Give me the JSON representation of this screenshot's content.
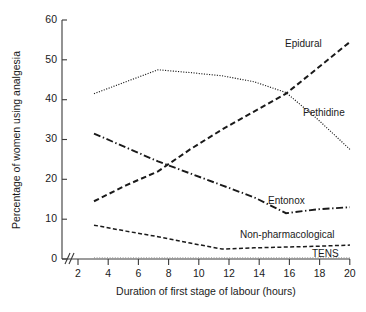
{
  "chart_data": {
    "type": "line",
    "title": "",
    "subtitle": "",
    "xlabel": "Duration of first stage of labour (hours)",
    "ylabel": "Percentage of women using analgesia",
    "xlim": [
      2,
      20
    ],
    "ylim": [
      0,
      60
    ],
    "x_ticks": [
      2,
      4,
      6,
      8,
      10,
      12,
      14,
      16,
      18,
      20
    ],
    "y_ticks": [
      0,
      10,
      20,
      30,
      40,
      50,
      60
    ],
    "grid": false,
    "legend_position": "inline-right",
    "axis_break": "//",
    "axis_break_note": "x-axis broken between origin and first tick",
    "x": [
      4,
      6,
      8,
      10,
      12,
      14,
      16,
      18,
      20
    ],
    "series": [
      {
        "name": "Epidural",
        "style": "dashed",
        "values": [
          14.5,
          18.5,
          22.0,
          27.5,
          32.5,
          37.0,
          41.5,
          48.0,
          54.5
        ],
        "label_x": 17.6,
        "label_y": 56.0
      },
      {
        "name": "Pethidine",
        "style": "dotted",
        "values": [
          41.5,
          44.5,
          47.5,
          46.8,
          46.0,
          44.5,
          41.8,
          35.0,
          27.5
        ],
        "label_x": 17.6,
        "label_y": 38.0
      },
      {
        "name": "Entonox",
        "style": "dash-dot",
        "values": [
          31.5,
          28.0,
          24.5,
          21.5,
          18.5,
          15.5,
          11.5,
          12.5,
          13.0
        ],
        "label_x": 15.2,
        "label_y": 16.5
      },
      {
        "name": "Non-pharmacological",
        "style": "dashed-fine",
        "values": [
          8.5,
          7.0,
          5.6,
          4.0,
          2.5,
          2.8,
          3.0,
          3.2,
          3.5
        ],
        "label_x": 13.6,
        "label_y": 6.8
      },
      {
        "name": "TENS",
        "style": "dotted-faint",
        "values": [
          0.3,
          0.3,
          0.3,
          0.3,
          0.3,
          0.3,
          0.3,
          0.3,
          0.3
        ],
        "label_x": 18.0,
        "label_y": 1.6
      }
    ]
  },
  "axes": {
    "x_title": "Duration of first stage of labour (hours)",
    "y_title": "Percentage of women using analgesia",
    "x_tick_labels": [
      "2",
      "4",
      "6",
      "8",
      "10",
      "12",
      "14",
      "16",
      "18",
      "20"
    ],
    "y_tick_labels": [
      "0",
      "10",
      "20",
      "30",
      "40",
      "50",
      "60"
    ]
  },
  "labels": {
    "epidural": "Epidural",
    "pethidine": "Pethidine",
    "entonox": "Entonox",
    "non_pharmacological": "Non-pharmacological",
    "tens": "TENS"
  },
  "colors": {
    "ink": "#1a1a1a",
    "axis": "#3a3a3a",
    "faint": "#8a8a8a",
    "background": "#ffffff"
  }
}
